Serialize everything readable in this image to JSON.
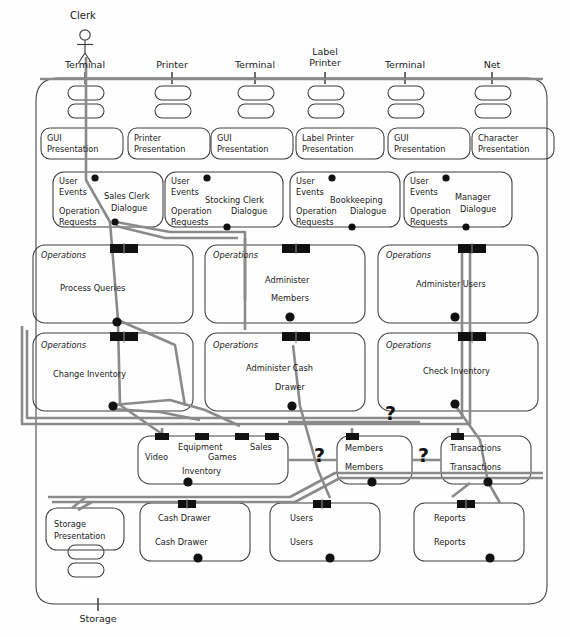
{
  "diagram": {
    "actor": {
      "name": "Clerk",
      "icon": "stick-figure-actor-icon"
    },
    "colors": {
      "outline": "#3d3d3d",
      "wire": "#8a8a8a",
      "socket": "#111111",
      "text": "#1b1b1b",
      "background": "#fefefe"
    },
    "top_ports": [
      {
        "label": "Terminal"
      },
      {
        "label": "Printer"
      },
      {
        "label": "Terminal"
      },
      {
        "label": "Label\nPrinter"
      },
      {
        "label": "Terminal"
      },
      {
        "label": "Net"
      }
    ],
    "bottom_port": {
      "label": "Storage"
    },
    "presentation_row": [
      {
        "lines": [
          "GUI",
          "Presentation"
        ]
      },
      {
        "lines": [
          "Printer",
          "Presentation"
        ]
      },
      {
        "lines": [
          "GUI",
          "Presentation"
        ]
      },
      {
        "lines": [
          "Label Printer",
          "Presentation"
        ]
      },
      {
        "lines": [
          "GUI",
          "Presentation"
        ]
      },
      {
        "lines": [
          "Character",
          "Presentation"
        ]
      }
    ],
    "dialogue_row": [
      {
        "in_label": "User\nEvents",
        "out_label": "Operation\nRequests",
        "name_lines": [
          "Sales Clerk",
          "Dialogue"
        ]
      },
      {
        "in_label": "User\nEvents",
        "out_label": "Operation\nRequests",
        "name_lines": [
          "Stocking Clerk",
          "Dialogue"
        ]
      },
      {
        "in_label": "User\nEvents",
        "out_label": "Operation\nRequests",
        "name_lines": [
          "Bookkeeping",
          "Dialogue"
        ]
      },
      {
        "in_label": "User\nEvents",
        "out_label": "Operation\nRequests",
        "name_lines": [
          "Manager",
          "Dialogue"
        ]
      }
    ],
    "operations_row_1": [
      {
        "iface": "Operations",
        "name_lines": [
          "Process Queries"
        ]
      },
      {
        "iface": "Operations",
        "name_lines": [
          "Administer",
          "Members"
        ]
      },
      {
        "iface": "Operations",
        "name_lines": [
          "Administer Users"
        ]
      }
    ],
    "operations_row_2": [
      {
        "iface": "Operations",
        "name_lines": [
          "Change Inventory"
        ]
      },
      {
        "iface": "Operations",
        "name_lines": [
          "Administer Cash",
          "Drawer"
        ]
      },
      {
        "iface": "Operations",
        "name_lines": [
          "Check Inventory"
        ]
      }
    ],
    "entity_row": [
      {
        "name": "inventory-component",
        "labels": [
          "Video",
          "Equipment",
          "Sales",
          "Games",
          "Inventory"
        ],
        "socket_count": 4
      },
      {
        "name": "members-component",
        "labels": [
          "Members",
          "Members"
        ],
        "socket_count": 1
      },
      {
        "name": "transactions-component",
        "labels": [
          "Transactions",
          "Transactions"
        ],
        "socket_count": 1
      }
    ],
    "storage_row": [
      {
        "name": "storage-presentation-component",
        "lines": [
          "Storage",
          "Presentation"
        ]
      },
      {
        "name": "cash-drawer-component",
        "labels": [
          "Cash Drawer",
          "Cash Drawer"
        ]
      },
      {
        "name": "users-component",
        "labels": [
          "Users",
          "Users"
        ]
      },
      {
        "name": "reports-component",
        "labels": [
          "Reports",
          "Reports"
        ]
      }
    ],
    "unknown_markers": [
      {
        "label": "?"
      },
      {
        "label": "?"
      },
      {
        "label": "?"
      }
    ]
  }
}
